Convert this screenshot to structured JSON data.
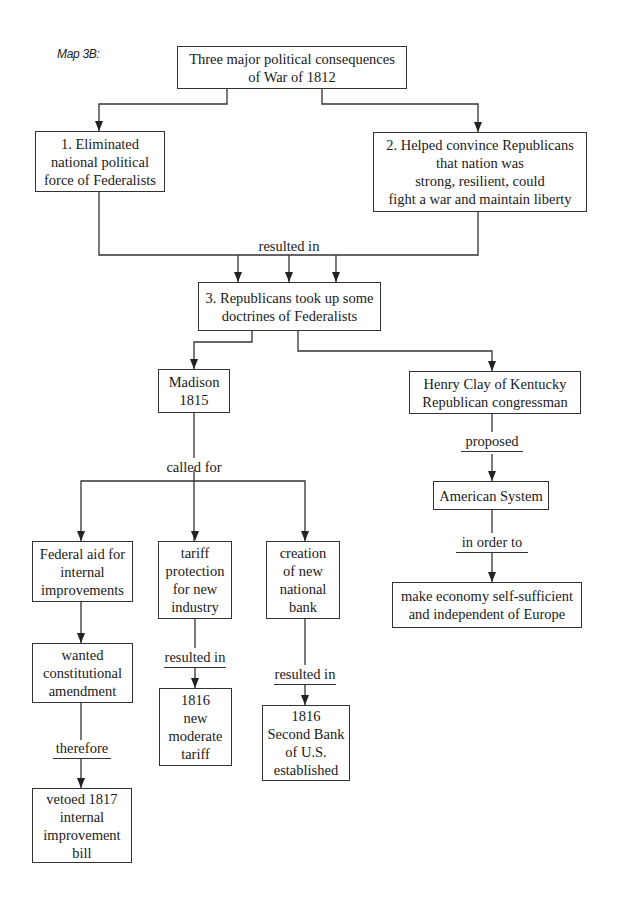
{
  "map_label": "Map 3B:",
  "nodes": {
    "root": [
      "Three major political consequences",
      "of War of 1812"
    ],
    "c1": [
      "1. Eliminated",
      "national political",
      "force of Federalists"
    ],
    "c2": [
      "2. Helped convince Republicans",
      "that nation was",
      "strong, resilient, could",
      "fight a war and maintain liberty"
    ],
    "c3": [
      "3. Republicans took up some",
      "doctrines of Federalists"
    ],
    "madison": [
      "Madison",
      "1815"
    ],
    "clay": [
      "Henry Clay of Kentucky",
      "Republican congressman"
    ],
    "american_system": [
      "American System"
    ],
    "economy": [
      "make economy self-sufficient",
      "and independent of Europe"
    ],
    "fed_aid": [
      "Federal aid for",
      "internal",
      "improvements"
    ],
    "tariff": [
      "tariff",
      "protection",
      "for new",
      "industry"
    ],
    "bank": [
      "creation",
      "of new",
      "national",
      "bank"
    ],
    "wanted": [
      "wanted",
      "constitutional",
      "amendment"
    ],
    "tariff_1816": [
      "1816",
      "new",
      "moderate",
      "tariff"
    ],
    "bank_1816": [
      "1816",
      "Second Bank",
      "of U.S.",
      "established"
    ],
    "vetoed": [
      "vetoed 1817",
      "internal",
      "improvement",
      "bill"
    ]
  },
  "links": {
    "resulted_in_main": "resulted in",
    "called_for": "called for",
    "proposed": "proposed",
    "in_order_to": "in order to",
    "resulted_in_tariff": "resulted in",
    "resulted_in_bank": "resulted in",
    "therefore": "therefore"
  },
  "colors": {
    "line": "#333333",
    "text": "#1a1a1a",
    "background": "#ffffff"
  }
}
